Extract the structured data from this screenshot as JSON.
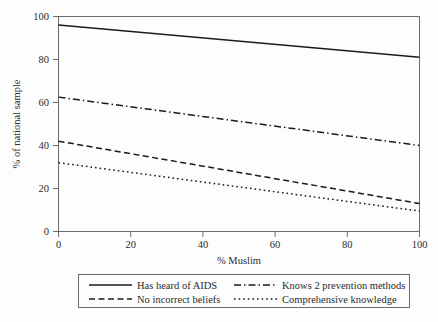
{
  "chart_data": {
    "type": "line",
    "title": "",
    "subtitle": "",
    "xlabel": "% Muslim",
    "ylabel": "% of national sample",
    "xlim": [
      0,
      100
    ],
    "ylim": [
      0,
      100
    ],
    "xticks": [
      0,
      20,
      40,
      60,
      80,
      100
    ],
    "xtick_labels": [
      "0",
      "20",
      "40",
      "60",
      "80",
      "100"
    ],
    "yticks": [
      0,
      20,
      40,
      60,
      80,
      100
    ],
    "ytick_labels": [
      "0",
      "20",
      "40",
      "60",
      "80",
      "100"
    ],
    "grid": false,
    "legend_position": "below-outside",
    "x": [
      0,
      100
    ],
    "series": [
      {
        "name": "Has heard of AIDS",
        "values": [
          96,
          81
        ],
        "linestyle": "solid",
        "color": "#1a1a1a"
      },
      {
        "name": "Knows 2 prevention methods",
        "values": [
          62.5,
          40
        ],
        "linestyle": "dashdot",
        "color": "#1a1a1a"
      },
      {
        "name": "No incorrect beliefs",
        "values": [
          42,
          13
        ],
        "linestyle": "dashed",
        "color": "#1a1a1a"
      },
      {
        "name": "Comprehensive knowledge",
        "values": [
          32,
          9.5
        ],
        "linestyle": "dotted",
        "color": "#1a1a1a"
      }
    ]
  },
  "axes": {
    "x_title": "% Muslim",
    "y_title": "% of national sample"
  },
  "legend": {
    "entries": [
      {
        "label": "Has heard of AIDS",
        "style": "solid"
      },
      {
        "label": "Knows 2 prevention methods",
        "style": "dashdot"
      },
      {
        "label": "No incorrect beliefs",
        "style": "dashed"
      },
      {
        "label": "Comprehensive knowledge",
        "style": "dotted"
      }
    ]
  },
  "colors": {
    "background": "#fdfdfd",
    "frame": "#6d6d6d",
    "line": "#1a1a1a",
    "text": "#2b2b2b"
  }
}
